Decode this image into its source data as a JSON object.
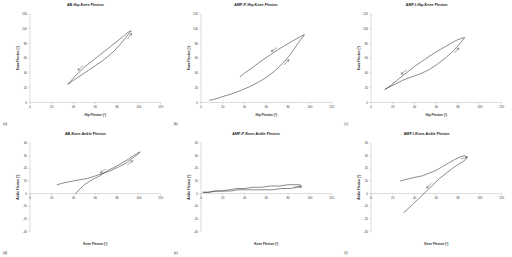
{
  "figure": {
    "background": "#ffffff",
    "curve_color": "#2b2b2b",
    "axis_color": "#a6a6a6",
    "rows": 2,
    "cols": 3
  },
  "chart_data": [
    {
      "type": "line",
      "panel_letter": "(a)",
      "title": "AB-Hip-Knee Flexion",
      "xlabel": "Hip Flexion (°)",
      "ylabel": "Knee Flexion (°)",
      "xlim": [
        0,
        120
      ],
      "ylim": [
        0,
        120
      ],
      "xticks": [
        0,
        20,
        40,
        60,
        80,
        100,
        120
      ],
      "yticks": [
        0,
        20,
        40,
        60,
        80,
        100,
        120
      ],
      "grid": false,
      "legend": "none",
      "annotations": [
        "direction-arrow-upper",
        "direction-arrow-lower"
      ],
      "series": [
        {
          "name": "Able-bodied hip-knee cyclogram",
          "x": [
            35,
            37,
            40,
            44,
            49,
            54,
            60,
            66,
            72,
            78,
            83,
            88,
            91,
            93,
            92,
            89,
            85,
            80,
            74,
            68,
            62,
            56,
            50,
            45,
            41,
            38,
            36,
            35
          ],
          "y": [
            25,
            27,
            30,
            34,
            39,
            44,
            50,
            56,
            63,
            71,
            79,
            88,
            94,
            97,
            97,
            94,
            89,
            83,
            76,
            69,
            62,
            55,
            48,
            41,
            35,
            30,
            27,
            25
          ]
        }
      ]
    },
    {
      "type": "line",
      "panel_letter": "(b)",
      "title": "AMP-P-Hip-Knee Flexion",
      "xlabel": "Hip Flexion (°)",
      "ylabel": "Knee Flexion (°)",
      "xlim": [
        0,
        120
      ],
      "ylim": [
        0,
        120
      ],
      "xticks": [
        0,
        20,
        40,
        60,
        80,
        100,
        120
      ],
      "yticks": [
        0,
        20,
        40,
        60,
        80,
        100,
        120
      ],
      "grid": false,
      "legend": "none",
      "annotations": [
        "direction-arrow-upper",
        "direction-arrow-lower"
      ],
      "series": [
        {
          "name": "Amputee prosthetic hip-knee cyclogram",
          "x": [
            8,
            11,
            16,
            22,
            29,
            36,
            44,
            52,
            60,
            68,
            75,
            82,
            88,
            93,
            95,
            92,
            86,
            79,
            71,
            63,
            55,
            47,
            40,
            36
          ],
          "y": [
            3,
            4,
            6,
            9,
            12,
            16,
            21,
            27,
            34,
            43,
            53,
            65,
            78,
            88,
            92,
            90,
            85,
            79,
            72,
            64,
            56,
            47,
            40,
            35
          ]
        }
      ]
    },
    {
      "type": "line",
      "panel_letter": "(c)",
      "title": "AMP-I-Hip-Knee Flexion",
      "xlabel": "Hip Flexion (°)",
      "ylabel": "Knee Flexion (°)",
      "xlim": [
        0,
        120
      ],
      "ylim": [
        0,
        120
      ],
      "xticks": [
        0,
        20,
        40,
        60,
        80,
        100,
        120
      ],
      "yticks": [
        0,
        20,
        40,
        60,
        80,
        100,
        120
      ],
      "grid": false,
      "legend": "none",
      "annotations": [
        "direction-arrow-upper",
        "direction-arrow-lower"
      ],
      "series": [
        {
          "name": "Amputee intact hip-knee cyclogram",
          "x": [
            13,
            17,
            21,
            25,
            29,
            34,
            40,
            47,
            54,
            61,
            68,
            75,
            81,
            85,
            86,
            83,
            78,
            72,
            65,
            57,
            49,
            41,
            34,
            28,
            23,
            19,
            15,
            13
          ],
          "y": [
            18,
            21,
            24,
            27,
            30,
            33,
            36,
            40,
            45,
            52,
            60,
            69,
            79,
            86,
            88,
            87,
            84,
            79,
            73,
            66,
            58,
            50,
            42,
            35,
            29,
            24,
            20,
            18
          ]
        }
      ]
    },
    {
      "type": "line",
      "panel_letter": "(d)",
      "title": "AB-Knee-Ankle Flexion",
      "xlabel": "Knee Flexion (°)",
      "ylabel": "Ankle Flexion (°)",
      "xlim": [
        0,
        120
      ],
      "ylim": [
        -30,
        40
      ],
      "xticks": [
        0,
        20,
        40,
        60,
        80,
        100,
        120
      ],
      "yticks": [
        -30,
        -20,
        -10,
        0,
        10,
        20,
        30,
        40
      ],
      "grid": false,
      "legend": "none",
      "annotations": [
        "direction-arrow-upper",
        "direction-arrow-lower"
      ],
      "series": [
        {
          "name": "Able-bodied knee-ankle cyclogram",
          "x": [
            25,
            29,
            34,
            40,
            46,
            53,
            60,
            67,
            74,
            81,
            88,
            94,
            99,
            101,
            99,
            95,
            90,
            84,
            78,
            71,
            64,
            57,
            50,
            45,
            42
          ],
          "y": [
            7,
            8,
            9,
            10,
            11,
            12,
            14,
            16,
            18,
            21,
            24,
            28,
            31,
            33,
            32,
            30,
            27,
            24,
            21,
            18,
            14,
            11,
            7,
            3,
            0
          ]
        }
      ]
    },
    {
      "type": "line",
      "panel_letter": "(e)",
      "title": "AMP-P-Knee-Ankle Flexion",
      "xlabel": "Knee Flexion (°)",
      "ylabel": "Ankle Flexion (°)",
      "xlim": [
        0,
        120
      ],
      "ylim": [
        -30,
        40
      ],
      "xticks": [
        0,
        20,
        40,
        60,
        80,
        100,
        120
      ],
      "yticks": [
        -30,
        -20,
        -10,
        0,
        10,
        20,
        30,
        40
      ],
      "grid": false,
      "legend": "none",
      "annotations": [
        "direction-arrow-upper"
      ],
      "series": [
        {
          "name": "Amputee prosthetic knee-ankle cyclogram",
          "x": [
            2,
            6,
            12,
            19,
            26,
            33,
            40,
            48,
            56,
            64,
            72,
            80,
            86,
            91,
            92,
            88,
            82,
            74,
            66,
            58,
            50,
            42,
            34,
            27,
            20,
            14,
            8,
            4,
            2
          ],
          "y": [
            1,
            1,
            2,
            2,
            3,
            4,
            4,
            5,
            5,
            6,
            6,
            7,
            7,
            7,
            6,
            5,
            4,
            4,
            3,
            3,
            3,
            3,
            3,
            2,
            2,
            2,
            1,
            1,
            1
          ]
        }
      ]
    },
    {
      "type": "line",
      "panel_letter": "(f)",
      "title": "AMP-I-Knee-Ankle Flexion",
      "xlabel": "Knee Flexion (°)",
      "ylabel": "Ankle Flexion (°)",
      "xlim": [
        0,
        120
      ],
      "ylim": [
        -30,
        40
      ],
      "xticks": [
        0,
        20,
        40,
        60,
        80,
        100,
        120
      ],
      "yticks": [
        -30,
        -20,
        -10,
        0,
        10,
        20,
        30,
        40
      ],
      "grid": false,
      "legend": "none",
      "annotations": [
        "direction-arrow-upper",
        "direction-arrow-lower"
      ],
      "series": [
        {
          "name": "Amputee intact knee-ankle cyclogram",
          "x": [
            27,
            31,
            36,
            41,
            47,
            53,
            59,
            65,
            71,
            77,
            82,
            86,
            88,
            87,
            84,
            80,
            75,
            69,
            63,
            57,
            51,
            45,
            39,
            34,
            30
          ],
          "y": [
            10,
            11,
            12,
            13,
            14,
            16,
            18,
            21,
            24,
            27,
            29,
            30,
            29,
            27,
            25,
            23,
            20,
            16,
            12,
            7,
            2,
            -3,
            -8,
            -12,
            -15
          ]
        }
      ]
    }
  ]
}
